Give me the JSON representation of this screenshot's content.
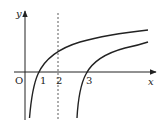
{
  "diagram": {
    "type": "function-graph",
    "axes": {
      "x_label": "x",
      "y_label": "y",
      "origin_label": "O"
    },
    "tick_labels": [
      "1",
      "2",
      "3"
    ],
    "dashed_line": {
      "x": 2
    },
    "curves": [
      {
        "name": "left-log-curve",
        "x_intercept": 1,
        "asymptote_x": 0
      },
      {
        "name": "right-log-curve",
        "x_intercept": 3,
        "asymptote_x": 2
      }
    ],
    "colors": {
      "stroke": "#222222",
      "background": "#ffffff"
    }
  }
}
